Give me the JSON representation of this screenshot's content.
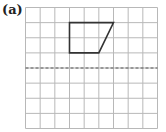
{
  "label": "(a)",
  "grid": {
    "columns": 9,
    "rows": 8
  },
  "shape": {
    "name": "trapezium",
    "vertices": [
      [
        3,
        1
      ],
      [
        6,
        1
      ],
      [
        5,
        3
      ],
      [
        3,
        3
      ]
    ],
    "stroke": "#333333"
  },
  "mirror_line": {
    "orientation": "horizontal",
    "row": 4,
    "style": "dashed",
    "color": "#555555"
  },
  "colors": {
    "grid": "#b8b8b8",
    "background": "#ffffff"
  }
}
